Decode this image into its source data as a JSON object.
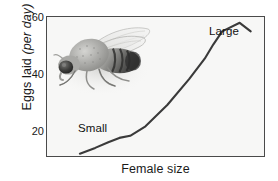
{
  "figure": {
    "background_color": "#ffffff",
    "plot_background_color": "#f7f7f6",
    "frame_color": "#4a4a4a",
    "line_color": "#3a3a3a"
  },
  "axes": {
    "y_title_main": "Eggs laid ",
    "y_title_italic": "(per day)",
    "x_title": "Female size",
    "y_ticks_major": [
      "20",
      "40",
      "60"
    ],
    "y_ticks_minor": [
      "30",
      "50"
    ]
  },
  "annotations": {
    "small": "Small",
    "large": "Large"
  },
  "illustration": {
    "name": "fruit-fly-photo",
    "description": "Grayscale photograph of a fruit fly (Drosophila) facing lower-left with wings folded back to the upper right"
  },
  "chart_data": {
    "type": "line",
    "title": "",
    "xlabel": "Female size",
    "ylabel": "Eggs laid (per day)",
    "ylim": [
      13,
      62
    ],
    "xlim": [
      0,
      100
    ],
    "grid": false,
    "legend": null,
    "y_tick_values": [
      20,
      40,
      60
    ],
    "y_minor_tick_values": [
      30,
      50
    ],
    "x_tick_values": [],
    "annotations": [
      {
        "text": "Small",
        "x": 17,
        "y": 24
      },
      {
        "text": "Large",
        "x": 78,
        "y": 58
      }
    ],
    "series": [
      {
        "name": "Eggs laid vs female size",
        "x": [
          15,
          22,
          28,
          33,
          38,
          45,
          55,
          65,
          72,
          76,
          80,
          88,
          93
        ],
        "y": [
          14.5,
          16.5,
          18.5,
          20.0,
          20.7,
          24.0,
          31.5,
          40.5,
          47.5,
          52.5,
          57.0,
          60.0,
          57.0
        ]
      }
    ]
  }
}
